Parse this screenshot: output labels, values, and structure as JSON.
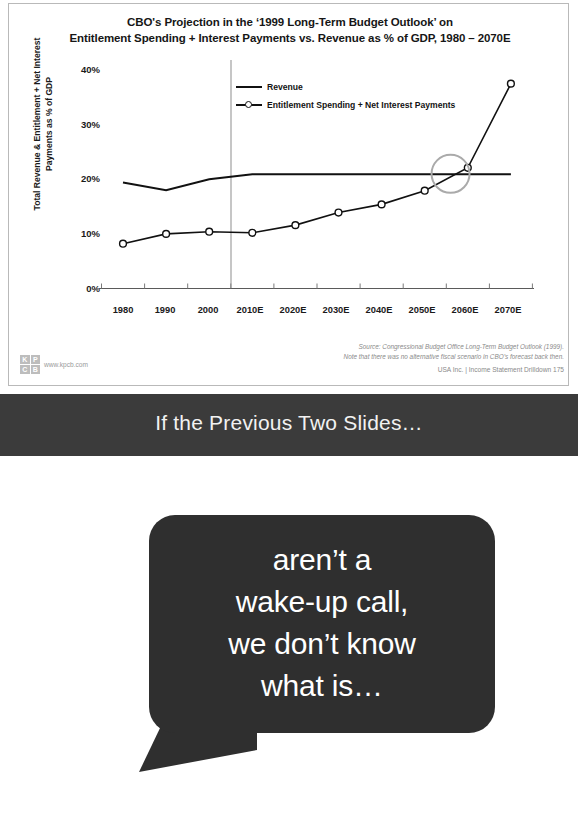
{
  "slide1": {
    "title_line1": "CBO's Projection in the ‘1999 Long-Term Budget Outlook’ on",
    "title_line2": "Entitlement Spending + Interest Payments vs. Revenue as % of GDP, 1980 – 2070E",
    "ylabel_line1": "Total Revenue & Entitlement + Net Interest",
    "ylabel_line2": "Payments as % of GDP",
    "source_line1": "Source: Congressional Budget Office Long-Term Budget Outlook (1999).",
    "source_line2": "Note that there was no alternative fiscal scenario in CBO’s forecast back then.",
    "footer": "USA Inc. | Income Statement Drilldown   175",
    "logo": {
      "k": "K",
      "p": "P",
      "c": "C",
      "b": "B",
      "url": "www.kpcb.com"
    }
  },
  "chart_data": {
    "type": "line",
    "title": "CBO's Projection in the ‘1999 Long-Term Budget Outlook’ on Entitlement Spending + Interest Payments vs. Revenue as % of GDP, 1980 – 2070E",
    "xlabel": "",
    "ylabel": "Total Revenue & Entitlement + Net Interest Payments as % of GDP",
    "categories": [
      "1980",
      "1990",
      "2000",
      "2010E",
      "2020E",
      "2030E",
      "2040E",
      "2050E",
      "2060E",
      "2070E"
    ],
    "yticks": [
      "0%",
      "10%",
      "20%",
      "30%",
      "40%"
    ],
    "ylim": [
      0,
      40
    ],
    "grid": false,
    "legend_position": "top-center",
    "series": [
      {
        "name": "Revenue",
        "marker": "none",
        "color": "#111111",
        "values": [
          19.4,
          18.0,
          20.0,
          20.9,
          20.9,
          20.9,
          20.9,
          20.9,
          20.9,
          20.9
        ]
      },
      {
        "name": "Entitlement Spending + Net Interest Payments",
        "marker": "open-circle",
        "color": "#111111",
        "values": [
          8.2,
          10.0,
          10.4,
          10.2,
          11.6,
          13.9,
          15.4,
          17.9,
          22.1,
          37.5
        ]
      }
    ],
    "annotations": [
      {
        "type": "vertical-line",
        "x": "between 2000 and 2010E",
        "note": "actual / projection divider"
      },
      {
        "type": "circle-highlight",
        "x": "between 2050E and 2060E",
        "y": 21,
        "note": "crossover point"
      }
    ]
  },
  "slide2": {
    "band_title": "If the Previous Two Slides…",
    "bubble_lines": [
      "aren’t a",
      "wake-up call,",
      "we don’t know",
      "what is…"
    ]
  }
}
